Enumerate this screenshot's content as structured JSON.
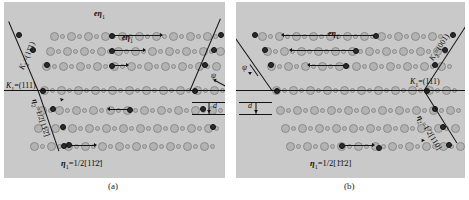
{
  "figure": {
    "type": "crystallographic-twinning-diagram",
    "background": "#c9c9c9",
    "atom_color": "#b3b3b3",
    "line_color": "#141414"
  },
  "captions": {
    "a": "(a)",
    "b": "(b)"
  },
  "panel_a": {
    "top_label": "eη",
    "top_label_sub": "1",
    "shear_arrow_label": "eη",
    "shear_arrow_label_sub": "1",
    "k2_label": "K",
    "k2_sub": "2",
    "k2_value": "=(11̄1)",
    "k1_label": "K",
    "k1_sub": "1",
    "k1_value": "=(111)",
    "eta2_label": "η",
    "eta2_sub": "2",
    "eta2_value": "=1/2[112̄]",
    "eta1_label": "η",
    "eta1_sub": "1",
    "eta1_value": "=1/2[11̄2̄]",
    "psi_label": "ψ",
    "d_label": "d"
  },
  "panel_b": {
    "shear_arrow_label": "eη",
    "shear_arrow_label_sub": "1",
    "k2_label": "K",
    "k2_sub": "2",
    "k2_value": "=(001)",
    "k1_label": "K",
    "k1_sub": "1",
    "k1_value": "=(111)",
    "eta2_label": "η",
    "eta2_sub": "2",
    "eta2_value": "=1/2[110]",
    "eta1_label": "η",
    "eta1_sub": "1",
    "eta1_value": "=1/2[1̄1̄2]",
    "psi_label": "ψ",
    "d_label": "d"
  },
  "chart_data": {
    "type": "scatter",
    "title": "",
    "xlabel": "",
    "ylabel": "",
    "panels": [
      {
        "name": "(a)",
        "k1": "(111)",
        "k2": "(11̄1)",
        "eta1": "1/2[11̄2̄]",
        "eta2": "1/2[112̄]",
        "k2_tilt_deg": -20,
        "k2_tilt_direction": "top-right to bottom-left in upper half, reversing below K1",
        "psi_deg": 20,
        "rows": 7,
        "atoms_per_row": 11
      },
      {
        "name": "(b)",
        "k1": "(111)",
        "k2": "(001)",
        "eta1": "1/2[1̄1̄2]",
        "eta2": "1/2[110]",
        "k2_tilt_deg": 35,
        "k2_tilt_direction": "bottom-left to top-right in upper half",
        "psi_deg": 35,
        "rows": 7,
        "atoms_per_row": 11
      }
    ],
    "shear_arrows": [
      {
        "panel": "(a)",
        "row": 1,
        "length_px": 52,
        "direction": "right"
      },
      {
        "panel": "(a)",
        "row": 2,
        "length_px": 35,
        "direction": "right"
      },
      {
        "panel": "(a)",
        "row": 3,
        "length_px": 18,
        "direction": "right"
      },
      {
        "panel": "(a)",
        "row": 5,
        "length_px": 18,
        "direction": "left"
      },
      {
        "panel": "(a)",
        "row": 7,
        "length_px": 34,
        "direction": "right"
      },
      {
        "panel": "(b)",
        "row": 1,
        "length_px": 90,
        "direction": "left"
      },
      {
        "panel": "(b)",
        "row": 2,
        "length_px": 62,
        "direction": "left"
      },
      {
        "panel": "(b)",
        "row": 3,
        "length_px": 34,
        "direction": "left"
      },
      {
        "panel": "(b)",
        "row": 7,
        "length_px": 34,
        "direction": "right"
      }
    ]
  }
}
